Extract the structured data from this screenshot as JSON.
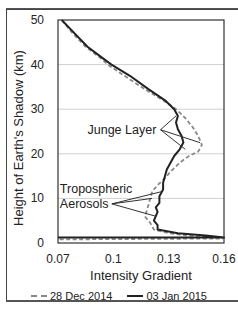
{
  "chart_data": {
    "type": "line",
    "title": "",
    "xlabel": "Intensity Gradient",
    "ylabel": "Height of Earth's Shadow (km)",
    "xlim": [
      0.07,
      0.16
    ],
    "ylim": [
      0,
      50
    ],
    "x_ticks": [
      "0.07",
      "0.1",
      "0.13",
      "0.16"
    ],
    "y_ticks": [
      "0",
      "10",
      "20",
      "30",
      "40",
      "50"
    ],
    "grid": {
      "horizontal": true,
      "vertical": false
    },
    "legend_position": "bottom",
    "series": [
      {
        "name": "28 Dec 2014",
        "style": "dashed",
        "color": "#888888",
        "points": [
          [
            0.072,
            50
          ],
          [
            0.078,
            47
          ],
          [
            0.085,
            44
          ],
          [
            0.093,
            41.5
          ],
          [
            0.097,
            40
          ],
          [
            0.106,
            37.5
          ],
          [
            0.117,
            34.5
          ],
          [
            0.127,
            32
          ],
          [
            0.134,
            30
          ],
          [
            0.139,
            28
          ],
          [
            0.143,
            26
          ],
          [
            0.146,
            24
          ],
          [
            0.148,
            22
          ],
          [
            0.146,
            20.5
          ],
          [
            0.141,
            19.5
          ],
          [
            0.136,
            18
          ],
          [
            0.131,
            16
          ],
          [
            0.128,
            14.5
          ],
          [
            0.124,
            13
          ],
          [
            0.121,
            11.5
          ],
          [
            0.12,
            10
          ],
          [
            0.119,
            8.5
          ],
          [
            0.118,
            7
          ],
          [
            0.117,
            6
          ],
          [
            0.12,
            4.5
          ],
          [
            0.122,
            3
          ],
          [
            0.13,
            2.2
          ],
          [
            0.145,
            1.5
          ],
          [
            0.16,
            1
          ],
          [
            0.07,
            0.8
          ]
        ]
      },
      {
        "name": "03 Jan 2015",
        "style": "solid",
        "color": "#222222",
        "points": [
          [
            0.072,
            50
          ],
          [
            0.079,
            47
          ],
          [
            0.086,
            44
          ],
          [
            0.094,
            41.5
          ],
          [
            0.099,
            40
          ],
          [
            0.109,
            37.5
          ],
          [
            0.119,
            34.5
          ],
          [
            0.128,
            32
          ],
          [
            0.133,
            30
          ],
          [
            0.135,
            28.5
          ],
          [
            0.134,
            27
          ],
          [
            0.135,
            25.5
          ],
          [
            0.137,
            24
          ],
          [
            0.138,
            22.5
          ],
          [
            0.136,
            21
          ],
          [
            0.133,
            19.5
          ],
          [
            0.131,
            18
          ],
          [
            0.129,
            16.5
          ],
          [
            0.128,
            15
          ],
          [
            0.127,
            13.5
          ],
          [
            0.127,
            12
          ],
          [
            0.125,
            10.5
          ],
          [
            0.125,
            9
          ],
          [
            0.123,
            8
          ],
          [
            0.124,
            7
          ],
          [
            0.123,
            6
          ],
          [
            0.122,
            5
          ],
          [
            0.124,
            4
          ],
          [
            0.124,
            3
          ],
          [
            0.135,
            2.2
          ],
          [
            0.15,
            1.7
          ],
          [
            0.16,
            1.2
          ],
          [
            0.07,
            1.2
          ]
        ]
      }
    ],
    "annotations": [
      {
        "text": "Junge Layer",
        "text_pos": [
          0.086,
          24.5
        ],
        "arrow_tips": [
          [
            0.134,
            28.5
          ],
          [
            0.147,
            22.5
          ],
          [
            0.139,
            21
          ]
        ]
      },
      {
        "text": "Tropospheric\nAerosols",
        "text_pos": [
          0.071,
          9
        ],
        "arrow_tips": [
          [
            0.126,
            11.5
          ],
          [
            0.121,
            10
          ],
          [
            0.123,
            6
          ]
        ]
      }
    ]
  },
  "ui": {
    "x_axis_label": "Intensity Gradient",
    "y_axis_label": "Height of Earth's Shadow (km)",
    "annotation_junge": "Junge Layer",
    "annotation_tropo_line1": "Tropospheric",
    "annotation_tropo_line2": "Aerosols",
    "legend": [
      {
        "label": "28 Dec 2014",
        "style": "dashed"
      },
      {
        "label": "03 Jan 2015",
        "style": "solid"
      }
    ]
  }
}
